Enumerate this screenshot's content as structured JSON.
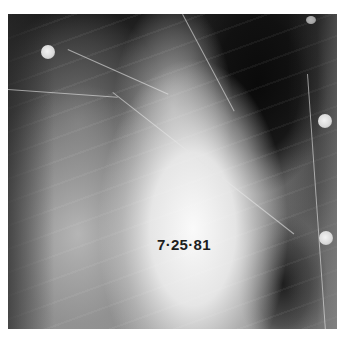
{
  "image": {
    "subject": "chest radiograph",
    "date_label": "7·25·81",
    "colors": {
      "background": "#ffffff",
      "dark_region": "#141414",
      "bright_region": "#f4f4f4",
      "label_text": "#1e1e1e"
    },
    "electrodes": [
      {
        "position": "upper-left"
      },
      {
        "position": "upper-right-small"
      },
      {
        "position": "right-middle"
      },
      {
        "position": "right-lower"
      }
    ]
  }
}
